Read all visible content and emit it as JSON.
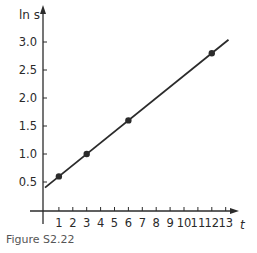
{
  "chart_data": {
    "type": "line",
    "title": "",
    "xlabel": "t",
    "ylabel": "ln s",
    "xlim": [
      0,
      13.5
    ],
    "ylim": [
      0,
      3.3
    ],
    "x_ticks": [
      1,
      2,
      3,
      4,
      5,
      6,
      7,
      8,
      9,
      10,
      11,
      12,
      13
    ],
    "x_tick_labels": [
      "1",
      "2",
      "3",
      "4",
      "5",
      "6",
      "7",
      "8",
      "9",
      "10",
      "11",
      "12",
      "13"
    ],
    "y_ticks": [
      0.5,
      1.0,
      1.5,
      2.0,
      2.5,
      3.0
    ],
    "y_tick_labels": [
      "0.5",
      "1.0",
      "1.5",
      "2.0",
      "2.5",
      "3.0"
    ],
    "grid": false,
    "series": [
      {
        "name": "data points",
        "kind": "scatter",
        "x": [
          1,
          3,
          6,
          12
        ],
        "y": [
          0.6,
          1.0,
          1.6,
          2.8
        ]
      },
      {
        "name": "fitted line",
        "kind": "line",
        "x": [
          0,
          13.2
        ],
        "y": [
          0.4,
          3.04
        ]
      }
    ],
    "colors": {
      "line": "#2b2b2b",
      "points": "#2b2b2b",
      "axes": "#2b2b2b"
    }
  },
  "caption": "Figure S2.22"
}
